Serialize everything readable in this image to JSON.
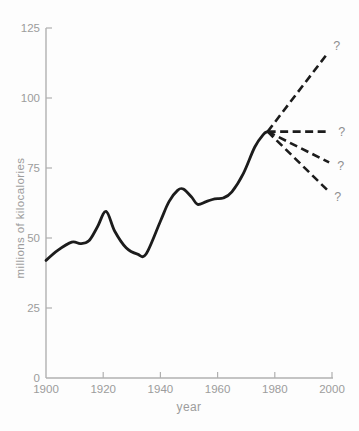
{
  "chart_data": {
    "type": "line",
    "title": "",
    "xlabel": "year",
    "ylabel": "millions of kilocalories",
    "xlim": [
      1900,
      2000
    ],
    "ylim": [
      0,
      125
    ],
    "x_ticks": [
      1900,
      1920,
      1940,
      1960,
      1980,
      2000
    ],
    "y_ticks": [
      0,
      25,
      50,
      75,
      100,
      125
    ],
    "grid": false,
    "legend": "none",
    "series": [
      {
        "name": "historical consumption",
        "style": "solid",
        "points": [
          [
            1900,
            42
          ],
          [
            1904,
            45.5
          ],
          [
            1909,
            48.5
          ],
          [
            1912,
            48
          ],
          [
            1915,
            49
          ],
          [
            1918,
            54
          ],
          [
            1921,
            59.5
          ],
          [
            1924,
            52.5
          ],
          [
            1928,
            46.5
          ],
          [
            1932,
            44.2
          ],
          [
            1935,
            44.3
          ],
          [
            1940,
            56
          ],
          [
            1943,
            63
          ],
          [
            1946,
            67
          ],
          [
            1948,
            67.5
          ],
          [
            1951,
            64.5
          ],
          [
            1953,
            62
          ],
          [
            1956,
            63
          ],
          [
            1959,
            64
          ],
          [
            1962,
            64.3
          ],
          [
            1965,
            66.5
          ],
          [
            1969,
            73
          ],
          [
            1973,
            82.5
          ],
          [
            1976,
            87
          ],
          [
            1977.5,
            88
          ]
        ]
      },
      {
        "name": "projection high",
        "style": "dashed",
        "points": [
          [
            1977.5,
            88
          ],
          [
            1998.5,
            116
          ]
        ],
        "end_label": "?"
      },
      {
        "name": "projection steady",
        "style": "dashed",
        "points": [
          [
            1977.5,
            88
          ],
          [
            1999,
            88
          ]
        ],
        "end_label": "?"
      },
      {
        "name": "projection moderate decline",
        "style": "dashed",
        "points": [
          [
            1977.5,
            88
          ],
          [
            1999,
            77
          ]
        ],
        "end_label": "?"
      },
      {
        "name": "projection steep decline",
        "style": "dashed",
        "points": [
          [
            1977.5,
            88
          ],
          [
            1998.5,
            67
          ]
        ],
        "end_label": "?"
      }
    ]
  },
  "colors": {
    "background": "#fdfdfd",
    "curve": "#1c1c1c",
    "projection": "#1c1c1c",
    "axis": "#b0b0b0",
    "tick_label": "#9c9c9c",
    "axis_title": "#9c9c9c",
    "question_mark": "#8f8f8f"
  }
}
